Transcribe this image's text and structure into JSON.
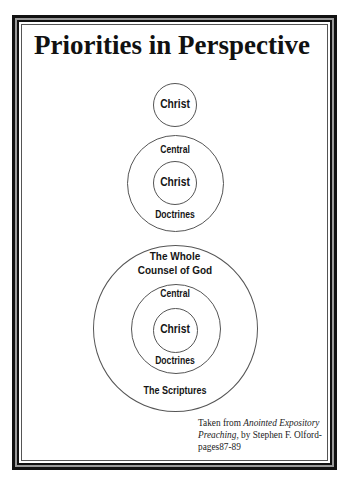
{
  "title": "Priorities in Perspective",
  "diagrams": [
    {
      "name": "christ-alone",
      "center": {
        "x": 175,
        "y": 105
      },
      "rings": [
        {
          "radius": 22,
          "labels_top": [],
          "labels_bottom": []
        }
      ],
      "core_label": "Christ"
    },
    {
      "name": "central-doctrines",
      "center": {
        "x": 175,
        "y": 183
      },
      "rings": [
        {
          "radius": 22
        },
        {
          "radius": 48,
          "label_top": "Central",
          "label_bottom": "Doctrines"
        }
      ],
      "core_label": "Christ"
    },
    {
      "name": "whole-counsel",
      "center": {
        "x": 175,
        "y": 328
      },
      "rings": [
        {
          "radius": 22
        },
        {
          "radius": 45,
          "label_top": "Central",
          "label_bottom": "Doctrines"
        },
        {
          "radius": 83,
          "label_top_lines": [
            "The Whole",
            "Counsel of God"
          ],
          "label_bottom": "The Scriptures"
        }
      ],
      "core_label": "Christ"
    }
  ],
  "labels": {
    "d1_core": "Christ",
    "d2_core": "Christ",
    "d2_top": "Central",
    "d2_bottom": "Doctrines",
    "d3_core": "Christ",
    "d3_mid_top": "Central",
    "d3_mid_bottom": "Doctrines",
    "d3_outer_top_1": "The Whole",
    "d3_outer_top_2": "Counsel of God",
    "d3_outer_bottom": "The Scriptures"
  },
  "citation": {
    "prefix": "Taken from ",
    "book_title": "Anointed Expository Preaching",
    "suffix": ", by Stephen F. Olford-",
    "pages": "pages87-89"
  },
  "colors": {
    "ink": "#111111",
    "circle_stroke": "#555555",
    "background": "#ffffff"
  }
}
